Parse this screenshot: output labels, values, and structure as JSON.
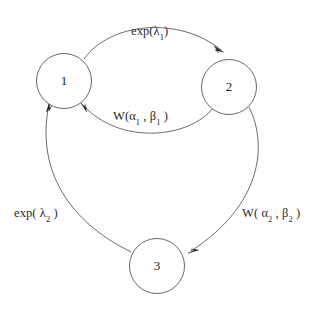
{
  "diagram": {
    "type": "state-transition-diagram",
    "background_color": "#ffffff",
    "stroke_color": "#55555a",
    "text_color": "#2a2a2f",
    "nodes": [
      {
        "id": "1",
        "label": "1",
        "cx": 64,
        "cy": 81,
        "r": 27.5
      },
      {
        "id": "2",
        "label": "2",
        "cx": 229,
        "cy": 87,
        "r": 27.5
      },
      {
        "id": "3",
        "label": "3",
        "cx": 157,
        "cy": 266,
        "r": 27.5
      }
    ],
    "edges": [
      {
        "id": "e12",
        "from": "1",
        "to": "2",
        "label_plain": "exp(λ1)",
        "label_base": "exp(λ",
        "label_sub": "1",
        "label_close": ")",
        "position": "top"
      },
      {
        "id": "e21",
        "from": "2",
        "to": "1",
        "label_plain": "W(α1 , β1 )",
        "label_w": "W(",
        "label_alpha": "α",
        "label_alpha_sub": "1",
        "label_comma": " , ",
        "label_beta": "β",
        "label_beta_sub": "1",
        "label_close": " )",
        "position": "middle"
      },
      {
        "id": "e23",
        "from": "2",
        "to": "3",
        "label_plain": "W( α2 , β2 )",
        "label_w": "W( ",
        "label_alpha": "α",
        "label_alpha_sub": "2",
        "label_comma": " , ",
        "label_beta": "β",
        "label_beta_sub": "2",
        "label_close": " )",
        "position": "right"
      },
      {
        "id": "e31",
        "from": "3",
        "to": "1",
        "label_plain": "exp( λ2 )",
        "label_base": "exp( λ",
        "label_sub": "2",
        "label_close": " )",
        "position": "left"
      }
    ]
  }
}
